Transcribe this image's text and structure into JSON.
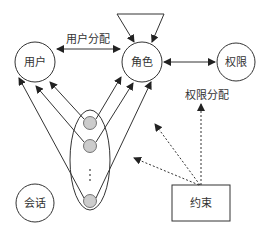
{
  "diagram": {
    "type": "RBAC model",
    "nodes": {
      "user": {
        "label": "用户"
      },
      "role": {
        "label": "角色"
      },
      "permission": {
        "label": "权限"
      },
      "session": {
        "label": "会话"
      },
      "constraint": {
        "label": "约束"
      }
    },
    "edges": {
      "user_assignment": {
        "label": "用户分配"
      },
      "permission_assignment": {
        "label": "权限分配"
      }
    },
    "session_group": {
      "ellipsis": "⋮",
      "session_dots": 3
    },
    "colors": {
      "stroke": "#333333",
      "session_fill": "#cccccc",
      "background": "#ffffff"
    }
  }
}
